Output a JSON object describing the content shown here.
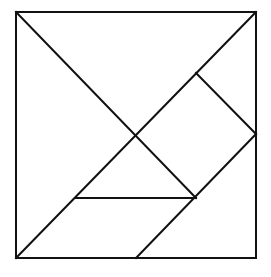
{
  "diagram": {
    "type": "tangram",
    "stroke_color": "#111111",
    "background_color": "#ffffff",
    "outer_square": {
      "x1": 16,
      "y1": 12,
      "x2": 256,
      "y2": 258
    },
    "segments": [
      {
        "id": "diag-tl-to-mid-lower",
        "x1": 16,
        "y1": 12,
        "x2": 196,
        "y2": 198
      },
      {
        "id": "diag-tr-to-bl",
        "x1": 256,
        "y1": 12,
        "x2": 16,
        "y2": 258
      },
      {
        "id": "upper-right-to-right-edge",
        "x1": 196,
        "y1": 73,
        "x2": 256,
        "y2": 134
      },
      {
        "id": "right-edge-to-bottom",
        "x1": 256,
        "y1": 134,
        "x2": 136,
        "y2": 258
      },
      {
        "id": "horizontal-mid-lower",
        "x1": 75,
        "y1": 198,
        "x2": 196,
        "y2": 198
      }
    ],
    "pieces": [
      {
        "name": "large-triangle-left",
        "points": [
          [
            16,
            12
          ],
          [
            16,
            258
          ],
          [
            136,
            135
          ]
        ]
      },
      {
        "name": "large-triangle-top",
        "points": [
          [
            16,
            12
          ],
          [
            256,
            12
          ],
          [
            136,
            135
          ]
        ]
      },
      {
        "name": "small-triangle-upper-right",
        "points": [
          [
            256,
            12
          ],
          [
            256,
            134
          ],
          [
            196,
            73
          ]
        ]
      },
      {
        "name": "square-right",
        "points": [
          [
            196,
            73
          ],
          [
            256,
            134
          ],
          [
            196,
            198
          ],
          [
            136,
            135
          ]
        ]
      },
      {
        "name": "small-triangle-middle",
        "points": [
          [
            136,
            135
          ],
          [
            196,
            198
          ],
          [
            75,
            198
          ]
        ]
      },
      {
        "name": "parallelogram-bottom",
        "points": [
          [
            75,
            198
          ],
          [
            196,
            198
          ],
          [
            136,
            258
          ],
          [
            16,
            258
          ]
        ]
      },
      {
        "name": "medium-triangle-bottom-right",
        "points": [
          [
            256,
            134
          ],
          [
            256,
            258
          ],
          [
            136,
            258
          ]
        ]
      }
    ]
  }
}
